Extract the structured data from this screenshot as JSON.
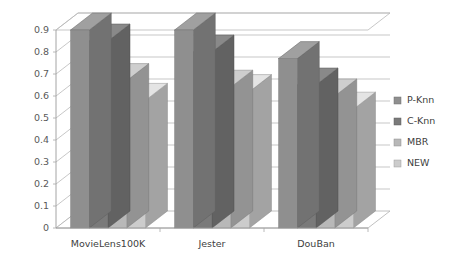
{
  "chart_data": {
    "type": "bar",
    "title": "",
    "subtitle": "",
    "xlabel": "",
    "ylabel": "",
    "categories": [
      "MovieLens100K",
      "Jester",
      "DouBan"
    ],
    "series": [
      {
        "name": "P-Knn",
        "values": [
          0.9,
          0.9,
          0.77
        ],
        "color": "#8f8f8f"
      },
      {
        "name": "C-Knn",
        "values": [
          0.85,
          0.8,
          0.65
        ],
        "color": "#7a7a7a"
      },
      {
        "name": "MBR",
        "values": [
          0.67,
          0.64,
          0.6
        ],
        "color": "#b8b8b8"
      },
      {
        "name": "NEW",
        "values": [
          0.58,
          0.62,
          0.54
        ],
        "color": "#cccccc"
      }
    ],
    "ylim": [
      0,
      0.9
    ],
    "ytick_labels": [
      "0.9",
      "0.8",
      "0.7",
      "0.6",
      "0.5",
      "0.4",
      "0.3",
      "0.2",
      "0.1",
      "0"
    ],
    "ytick_values": [
      0.9,
      0.8,
      0.7,
      0.6,
      0.5,
      0.4,
      0.3,
      0.2,
      0.1,
      0
    ],
    "grid": true,
    "legend_position": "right",
    "style": "3d-column-grayscale"
  },
  "legend": {
    "items": [
      {
        "label": "P-Knn",
        "color": "#8f8f8f"
      },
      {
        "label": "C-Knn",
        "color": "#7a7a7a"
      },
      {
        "label": "MBR",
        "color": "#b8b8b8"
      },
      {
        "label": "NEW",
        "color": "#cccccc"
      }
    ]
  },
  "axes": {
    "y_ticks": [
      "0.9",
      "0.8",
      "0.7",
      "0.6",
      "0.5",
      "0.4",
      "0.3",
      "0.2",
      "0.1",
      "0"
    ],
    "x_ticks": [
      "MovieLens100K",
      "Jester",
      "DouBan"
    ]
  }
}
